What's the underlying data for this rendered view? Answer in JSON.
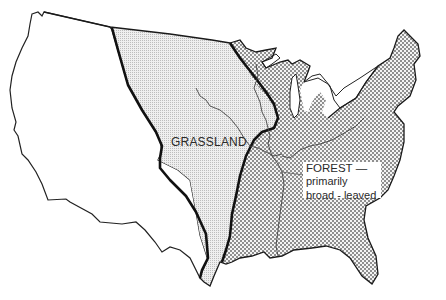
{
  "map": {
    "title": "",
    "regions": [
      {
        "id": "west",
        "label": "",
        "fill": "#ffffff",
        "pattern": "none"
      },
      {
        "id": "grassland",
        "label": "GRASSLAND",
        "fill": "#e6e6e6",
        "pattern": "fine-dots"
      },
      {
        "id": "forest",
        "label_lines": [
          "FOREST —",
          "primarily",
          "broad - leaved"
        ],
        "fill": "#c9c9c9",
        "pattern": "checker"
      }
    ],
    "colors": {
      "background": "#ffffff",
      "outline": "#1a1a1a",
      "grass_fill": "#e8e8e8",
      "forest_a": "#ffffff",
      "forest_b": "#9a9a9a"
    }
  },
  "labels": {
    "grassland": "GRASSLAND",
    "forest_line1": "FOREST —",
    "forest_line2": "primarily",
    "forest_line3": "broad - leaved"
  }
}
